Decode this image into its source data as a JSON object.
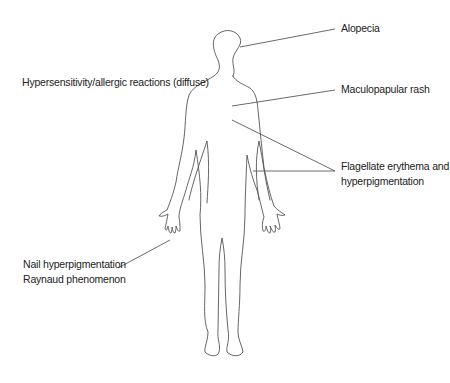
{
  "diagram": {
    "type": "body-outline-annotation",
    "colors": {
      "outline": "#555555",
      "leader": "#444444",
      "text": "#222222",
      "background": "#ffffff"
    },
    "labels": {
      "alopecia": {
        "text": "Alopecia"
      },
      "hypersensitivity": {
        "text": "Hypersensitivity/allergic reactions (diffuse)"
      },
      "maculopapular": {
        "text": "Maculopapular rash"
      },
      "flagellate": {
        "line1": "Flagellate erythema and",
        "line2": "hyperpigmentation"
      },
      "nail": {
        "line1": "Nail hyperpigmentation",
        "line2": "Raynaud phenomenon"
      }
    }
  }
}
